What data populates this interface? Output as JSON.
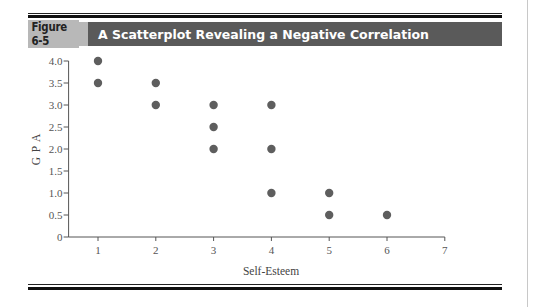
{
  "figure": {
    "label": "Figure 6-5",
    "title": "A Scatterplot Revealing a Negative Correlation"
  },
  "colors": {
    "label_bg": "#b8b8b8",
    "title_bg": "#5a5a5a",
    "point": "#5e5e5e"
  },
  "chart_data": {
    "type": "scatter",
    "title": "A Scatterplot Revealing a Negative Correlation",
    "xlabel": "Self-Esteem",
    "ylabel": "G P A",
    "xlim": [
      0.5,
      7
    ],
    "ylim": [
      0,
      4.0
    ],
    "x_ticks": [
      "1",
      "2",
      "3",
      "4",
      "5",
      "6",
      "7"
    ],
    "y_ticks": [
      "0",
      "0.5",
      "1.0",
      "1.5",
      "2.0",
      "2.5",
      "3.0",
      "3.5",
      "4.0"
    ],
    "grid": false,
    "legend": null,
    "points": [
      {
        "x": 1,
        "y": 4.0
      },
      {
        "x": 1,
        "y": 3.5
      },
      {
        "x": 2,
        "y": 3.5
      },
      {
        "x": 2,
        "y": 3.0
      },
      {
        "x": 3,
        "y": 3.0
      },
      {
        "x": 3,
        "y": 2.5
      },
      {
        "x": 3,
        "y": 2.0
      },
      {
        "x": 4,
        "y": 3.0
      },
      {
        "x": 4,
        "y": 2.0
      },
      {
        "x": 4,
        "y": 1.0
      },
      {
        "x": 5,
        "y": 1.0
      },
      {
        "x": 5,
        "y": 0.5
      },
      {
        "x": 6,
        "y": 0.5
      }
    ]
  }
}
